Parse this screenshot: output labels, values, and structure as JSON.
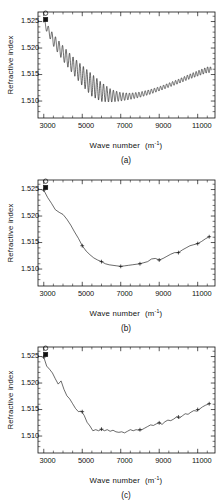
{
  "figure": {
    "panels": [
      {
        "caption": "(a)",
        "xlabel_main": "Wave number",
        "xlabel_unit": "(m",
        "xlabel_sup": "-1",
        "xlabel_close": ")",
        "ylabel": "Refractive index"
      },
      {
        "caption": "(b)",
        "xlabel_main": "Wave number",
        "xlabel_unit": "(m",
        "xlabel_sup": "-1",
        "xlabel_close": ")",
        "ylabel": "Refractive index"
      },
      {
        "caption": "(c)",
        "xlabel_main": "Wave number",
        "xlabel_unit": "(m",
        "xlabel_sup": "-1",
        "xlabel_close": ")",
        "ylabel": "Refractive index"
      }
    ],
    "xticklabels": [
      "3000",
      "5000",
      "7000",
      "9000",
      "11000"
    ],
    "yticklabels": [
      "1.525",
      "1.520",
      "1.515",
      "1.510"
    ]
  },
  "chart_data": [
    {
      "type": "line",
      "title": "(a)",
      "xlabel": "Wave number (m-1)",
      "ylabel": "Refractive index",
      "xlim": [
        2700,
        11900
      ],
      "ylim": [
        1.5068,
        1.5268
      ],
      "xticks": [
        3000,
        5000,
        7000,
        9000,
        11000
      ],
      "yticks": [
        1.525,
        1.52,
        1.515,
        1.51
      ],
      "grid": false,
      "legend": null,
      "description": "Interference-fringe oscillations superimposed on a dispersion baseline; amplitude largest near 5000-6500 m-1 and decaying toward high wave number.",
      "markers": [
        {
          "name": "open-circle-start",
          "x": 3000,
          "y": 1.5262
        },
        {
          "name": "filled-square-start",
          "x": 3000,
          "y": 1.5249
        }
      ],
      "baseline": {
        "x": [
          3000,
          3500,
          4000,
          4500,
          5000,
          5500,
          6000,
          6500,
          7000,
          7500,
          8000,
          8500,
          9000,
          9500,
          10000,
          10500,
          11000,
          11500
        ],
        "y": [
          1.5249,
          1.5215,
          1.519,
          1.5168,
          1.5148,
          1.513,
          1.5117,
          1.511,
          1.5108,
          1.5109,
          1.5112,
          1.5117,
          1.5123,
          1.513,
          1.5137,
          1.5145,
          1.5152,
          1.5159
        ]
      },
      "oscillation": {
        "amplitude_envelope": [
          0.0006,
          0.0011,
          0.0014,
          0.0016,
          0.0019,
          0.0021,
          0.0018,
          0.0012,
          0.0008,
          0.0006,
          0.0005,
          0.00045,
          0.0004,
          0.0004,
          0.00042,
          0.00045,
          0.0005,
          0.00055
        ],
        "fringe_count": 46
      }
    },
    {
      "type": "line",
      "title": "(b)",
      "xlabel": "Wave number (m-1)",
      "ylabel": "Refractive index",
      "xlim": [
        2700,
        11900
      ],
      "ylim": [
        1.5068,
        1.5268
      ],
      "xticks": [
        3000,
        5000,
        7000,
        9000,
        11000
      ],
      "yticks": [
        1.525,
        1.52,
        1.515,
        1.51
      ],
      "grid": false,
      "legend": null,
      "description": "Smoothed dispersion curve with plus-symbol data points; minimum near 7000 m-1.",
      "markers": [
        {
          "name": "open-circle-start",
          "x": 3000,
          "y": 1.5262
        },
        {
          "name": "filled-square-start",
          "x": 3000,
          "y": 1.5249
        }
      ],
      "series": [
        {
          "name": "smoothed curve",
          "x": [
            3000,
            3200,
            3400,
            3600,
            3800,
            4000,
            4200,
            4400,
            4600,
            4800,
            5000,
            5200,
            5400,
            5600,
            5800,
            6000,
            6200,
            6400,
            6600,
            6800,
            7000,
            7200,
            7400,
            7600,
            7800,
            8000,
            8200,
            8400,
            8600,
            8800,
            9000,
            9200,
            9400,
            9600,
            9800,
            10000,
            10200,
            10400,
            10600,
            10800,
            11000,
            11200,
            11400,
            11600
          ],
          "y": [
            1.5249,
            1.5235,
            1.5224,
            1.5212,
            1.5207,
            1.5203,
            1.5194,
            1.5183,
            1.517,
            1.5158,
            1.5144,
            1.5134,
            1.5127,
            1.5121,
            1.5117,
            1.5114,
            1.511,
            1.5108,
            1.5107,
            1.5106,
            1.5105,
            1.5106,
            1.5107,
            1.5108,
            1.5109,
            1.511,
            1.5112,
            1.5114,
            1.5119,
            1.512,
            1.5117,
            1.512,
            1.5124,
            1.5128,
            1.5131,
            1.5131,
            1.5136,
            1.514,
            1.5144,
            1.5146,
            1.5148,
            1.5152,
            1.5157,
            1.5161
          ]
        }
      ],
      "data_points": [
        {
          "x": 3000,
          "y": 1.5249
        },
        {
          "x": 5000,
          "y": 1.5144
        },
        {
          "x": 6000,
          "y": 1.5114
        },
        {
          "x": 7000,
          "y": 1.5105
        },
        {
          "x": 8000,
          "y": 1.511
        },
        {
          "x": 9000,
          "y": 1.5117
        },
        {
          "x": 10000,
          "y": 1.5131
        },
        {
          "x": 11000,
          "y": 1.5148
        },
        {
          "x": 11600,
          "y": 1.5161
        }
      ]
    },
    {
      "type": "line",
      "title": "(c)",
      "xlabel": "Wave number (m-1)",
      "ylabel": "Refractive index",
      "xlim": [
        2700,
        11900
      ],
      "ylim": [
        1.5068,
        1.5268
      ],
      "xticks": [
        3000,
        5000,
        7000,
        9000,
        11000
      ],
      "yticks": [
        1.525,
        1.52,
        1.515,
        1.51
      ],
      "grid": false,
      "legend": null,
      "description": "Partially smoothed curve retaining residual ripple, with plus-symbol data points; minimum plateau near 6000-7000 m-1.",
      "markers": [
        {
          "name": "open-circle-start",
          "x": 3000,
          "y": 1.5262
        },
        {
          "name": "filled-square-start",
          "x": 3000,
          "y": 1.5249
        }
      ],
      "series": [
        {
          "name": "residual-ripple curve",
          "x": [
            3000,
            3150,
            3300,
            3450,
            3600,
            3750,
            3900,
            4050,
            4200,
            4350,
            4500,
            4650,
            4800,
            4950,
            5100,
            5250,
            5400,
            5550,
            5700,
            5850,
            6000,
            6150,
            6300,
            6450,
            6600,
            6750,
            6900,
            7050,
            7200,
            7350,
            7500,
            7650,
            7800,
            7950,
            8100,
            8250,
            8400,
            8550,
            8700,
            8850,
            9000,
            9150,
            9300,
            9450,
            9600,
            9750,
            9900,
            10050,
            10200,
            10350,
            10500,
            10650,
            10800,
            10950,
            11100,
            11250,
            11400,
            11600
          ],
          "y": [
            1.5249,
            1.5232,
            1.5226,
            1.5219,
            1.5208,
            1.5198,
            1.5204,
            1.5188,
            1.5176,
            1.517,
            1.5161,
            1.5152,
            1.5146,
            1.5147,
            1.5139,
            1.5126,
            1.5119,
            1.511,
            1.5112,
            1.511,
            1.5113,
            1.511,
            1.5112,
            1.5109,
            1.5111,
            1.5108,
            1.5107,
            1.5108,
            1.5106,
            1.5109,
            1.5112,
            1.511,
            1.5112,
            1.5111,
            1.5112,
            1.5115,
            1.5118,
            1.5121,
            1.512,
            1.5123,
            1.5125,
            1.5122,
            1.5127,
            1.513,
            1.5129,
            1.5132,
            1.5136,
            1.5134,
            1.5138,
            1.5142,
            1.5141,
            1.5145,
            1.5148,
            1.5147,
            1.5151,
            1.5155,
            1.5158,
            1.5161
          ]
        }
      ],
      "data_points": [
        {
          "x": 3000,
          "y": 1.5249
        },
        {
          "x": 5000,
          "y": 1.5146
        },
        {
          "x": 6000,
          "y": 1.5113
        },
        {
          "x": 8000,
          "y": 1.5112
        },
        {
          "x": 9000,
          "y": 1.5125
        },
        {
          "x": 10000,
          "y": 1.5136
        },
        {
          "x": 11000,
          "y": 1.515
        },
        {
          "x": 11600,
          "y": 1.5161
        }
      ]
    }
  ]
}
